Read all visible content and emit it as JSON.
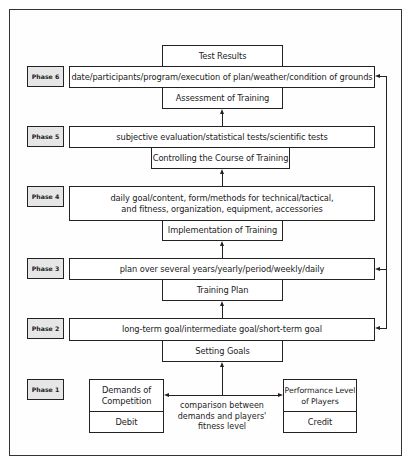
{
  "diagram": {
    "phases": [
      {
        "label": "Phase 6",
        "top_box": "Test Results",
        "detail": "date/participants/program/execution of plan/weather/condition of grounds",
        "stage": "Assessment of Training"
      },
      {
        "label": "Phase 5",
        "detail": "subjective evaluation/statistical tests/scientific tests",
        "stage": "Controlling the Course of Training"
      },
      {
        "label": "Phase 4",
        "detail_line1": "daily goal/content, form/methods for technical/tactical,",
        "detail_line2": "and fitness, organization, equipment, accessories",
        "stage": "Implementation of Training"
      },
      {
        "label": "Phase 3",
        "detail": "plan over several years/yearly/period/weekly/daily",
        "stage": "Training Plan"
      },
      {
        "label": "Phase 2",
        "detail": "long-term goal/intermediate goal/short-term goal",
        "stage": "Setting Goals"
      },
      {
        "label": "Phase 1",
        "left_box": {
          "title_line1": "Demands of",
          "title_line2": "Competition",
          "sub": "Debit"
        },
        "right_box": {
          "title_line1": "Performance Level",
          "title_line2": "of Players",
          "sub": "Credit"
        },
        "comparison_line1": "comparison between",
        "comparison_line2": "demands and players'",
        "comparison_line3": "fitness level"
      }
    ],
    "feedback_targets": [
      "Phase 6",
      "Phase 3",
      "Phase 2"
    ]
  }
}
